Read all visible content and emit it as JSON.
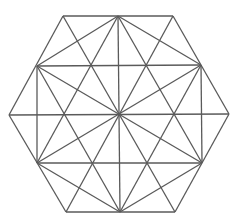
{
  "figure": {
    "type": "geometric-diagram",
    "stroke_color": "#5a5a5a",
    "background": "#ffffff",
    "points": {
      "V_TL": [
        63,
        16
      ],
      "V_TR": [
        173,
        16
      ],
      "V_R": [
        229,
        114
      ],
      "V_BR": [
        175,
        212
      ],
      "V_BL": [
        66,
        212
      ],
      "V_L": [
        9,
        115
      ],
      "M_T": [
        118,
        16
      ],
      "M_UR": [
        201,
        65
      ],
      "M_LR": [
        202,
        163
      ],
      "M_B": [
        120,
        212
      ],
      "M_LL": [
        37,
        163
      ],
      "M_UL": [
        37,
        66
      ],
      "C": [
        119,
        114
      ]
    },
    "segments": [
      [
        "V_TL",
        "V_TR"
      ],
      [
        "V_TR",
        "V_R"
      ],
      [
        "V_R",
        "V_BR"
      ],
      [
        "V_BR",
        "V_BL"
      ],
      [
        "V_BL",
        "V_L"
      ],
      [
        "V_L",
        "V_TL"
      ],
      [
        "V_TL",
        "V_BR"
      ],
      [
        "V_TR",
        "V_BL"
      ],
      [
        "V_L",
        "V_R"
      ],
      [
        "M_T",
        "M_UR"
      ],
      [
        "M_UR",
        "M_LR"
      ],
      [
        "M_LR",
        "M_B"
      ],
      [
        "M_B",
        "M_LL"
      ],
      [
        "M_LL",
        "M_UL"
      ],
      [
        "M_UL",
        "M_T"
      ],
      [
        "M_T",
        "M_B"
      ],
      [
        "M_UL",
        "M_LR"
      ],
      [
        "M_UR",
        "M_LL"
      ],
      [
        "M_T",
        "M_LL"
      ],
      [
        "M_LL",
        "M_LR"
      ],
      [
        "M_LR",
        "M_T"
      ],
      [
        "M_B",
        "M_UL"
      ],
      [
        "M_UL",
        "M_UR"
      ],
      [
        "M_UR",
        "M_B"
      ]
    ]
  }
}
